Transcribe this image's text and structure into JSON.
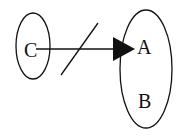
{
  "diagram": {
    "type": "set-mapping",
    "nodes": [
      {
        "id": "C",
        "label": "C",
        "set": "left"
      },
      {
        "id": "A",
        "label": "A",
        "set": "right"
      },
      {
        "id": "B",
        "label": "B",
        "set": "right"
      }
    ],
    "sets": [
      {
        "id": "left",
        "members": [
          "C"
        ]
      },
      {
        "id": "right",
        "members": [
          "A",
          "B"
        ]
      }
    ],
    "edges": [
      {
        "from": "C",
        "to": "A",
        "style": "arrow",
        "negated": true
      }
    ],
    "colors": {
      "stroke": "#111111",
      "background": "#ffffff"
    }
  }
}
